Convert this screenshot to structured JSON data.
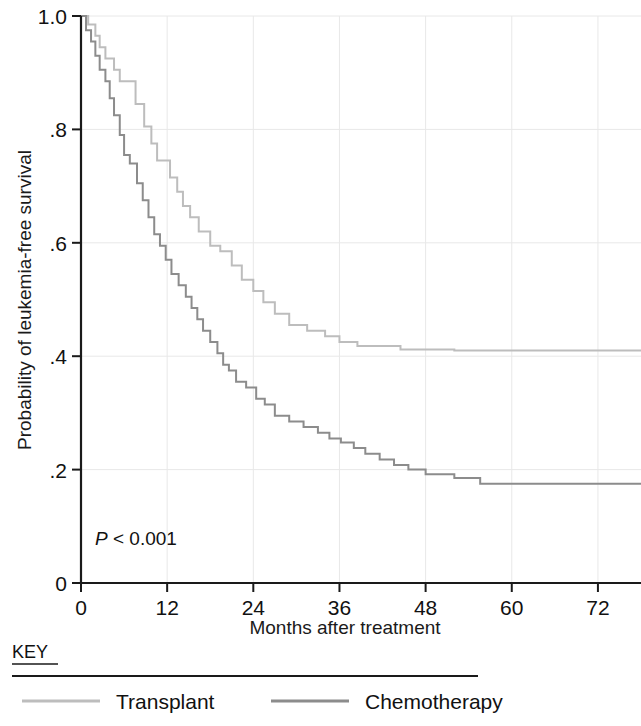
{
  "chart_data": {
    "type": "line",
    "title": "",
    "subtitle": "",
    "xlabel": "Months after treatment",
    "ylabel": "Probability of leukemia-free survival",
    "xlim": [
      0,
      78
    ],
    "ylim": [
      0,
      1.0
    ],
    "xticks": [
      0,
      12,
      24,
      36,
      48,
      60,
      72
    ],
    "xtick_labels": [
      "0",
      "12",
      "24",
      "36",
      "48",
      "60",
      "72"
    ],
    "yticks": [
      0,
      0.2,
      0.4,
      0.6,
      0.8,
      1.0
    ],
    "ytick_labels": [
      "0",
      ".2",
      ".4",
      ".6",
      ".8",
      "1.0"
    ],
    "grid": true,
    "legend_position": "below-axis",
    "step_type": "post",
    "annotations": [
      {
        "name": "p-value",
        "text_italic": "P",
        "text_rest": " < 0.001",
        "x": 3,
        "y": 0.075
      }
    ],
    "series": [
      {
        "name": "Transplant",
        "color": "#bdbdbd",
        "final_value": 0.41,
        "points": [
          [
            0,
            1.0
          ],
          [
            1.0,
            1.0
          ],
          [
            1.0,
            0.985
          ],
          [
            2.0,
            0.985
          ],
          [
            2.0,
            0.965
          ],
          [
            2.6,
            0.965
          ],
          [
            2.6,
            0.945
          ],
          [
            3.4,
            0.945
          ],
          [
            3.4,
            0.925
          ],
          [
            4.6,
            0.925
          ],
          [
            4.6,
            0.905
          ],
          [
            5.4,
            0.905
          ],
          [
            5.4,
            0.885
          ],
          [
            7.6,
            0.885
          ],
          [
            7.6,
            0.845
          ],
          [
            8.8,
            0.845
          ],
          [
            8.8,
            0.805
          ],
          [
            9.8,
            0.805
          ],
          [
            9.8,
            0.775
          ],
          [
            10.6,
            0.775
          ],
          [
            10.6,
            0.745
          ],
          [
            12.4,
            0.745
          ],
          [
            12.4,
            0.715
          ],
          [
            13.4,
            0.715
          ],
          [
            13.4,
            0.69
          ],
          [
            14.2,
            0.69
          ],
          [
            14.2,
            0.665
          ],
          [
            15.2,
            0.665
          ],
          [
            15.2,
            0.645
          ],
          [
            16.4,
            0.645
          ],
          [
            16.4,
            0.62
          ],
          [
            18.0,
            0.62
          ],
          [
            18.0,
            0.595
          ],
          [
            19.4,
            0.595
          ],
          [
            19.4,
            0.585
          ],
          [
            21.0,
            0.585
          ],
          [
            21.0,
            0.56
          ],
          [
            22.4,
            0.56
          ],
          [
            22.4,
            0.535
          ],
          [
            24.0,
            0.535
          ],
          [
            24.0,
            0.515
          ],
          [
            25.4,
            0.515
          ],
          [
            25.4,
            0.495
          ],
          [
            27.0,
            0.495
          ],
          [
            27.0,
            0.475
          ],
          [
            29.0,
            0.475
          ],
          [
            29.0,
            0.455
          ],
          [
            31.5,
            0.455
          ],
          [
            31.5,
            0.445
          ],
          [
            34.0,
            0.445
          ],
          [
            34.0,
            0.435
          ],
          [
            36.0,
            0.435
          ],
          [
            36.0,
            0.425
          ],
          [
            38.5,
            0.425
          ],
          [
            38.5,
            0.418
          ],
          [
            44.5,
            0.418
          ],
          [
            44.5,
            0.412
          ],
          [
            52.0,
            0.412
          ],
          [
            52.0,
            0.41
          ],
          [
            78,
            0.41
          ]
        ]
      },
      {
        "name": "Chemotherapy",
        "color": "#8c8c8c",
        "final_value": 0.175,
        "points": [
          [
            0,
            1.0
          ],
          [
            0.7,
            1.0
          ],
          [
            0.7,
            0.975
          ],
          [
            1.4,
            0.975
          ],
          [
            1.4,
            0.955
          ],
          [
            2.0,
            0.955
          ],
          [
            2.0,
            0.93
          ],
          [
            2.6,
            0.93
          ],
          [
            2.6,
            0.905
          ],
          [
            3.4,
            0.905
          ],
          [
            3.4,
            0.885
          ],
          [
            4.0,
            0.885
          ],
          [
            4.0,
            0.855
          ],
          [
            4.6,
            0.855
          ],
          [
            4.6,
            0.825
          ],
          [
            5.4,
            0.825
          ],
          [
            5.4,
            0.79
          ],
          [
            6.0,
            0.79
          ],
          [
            6.0,
            0.755
          ],
          [
            6.8,
            0.755
          ],
          [
            6.8,
            0.74
          ],
          [
            7.8,
            0.74
          ],
          [
            7.8,
            0.705
          ],
          [
            8.6,
            0.705
          ],
          [
            8.6,
            0.675
          ],
          [
            9.4,
            0.675
          ],
          [
            9.4,
            0.645
          ],
          [
            10.2,
            0.645
          ],
          [
            10.2,
            0.615
          ],
          [
            11.0,
            0.615
          ],
          [
            11.0,
            0.595
          ],
          [
            11.8,
            0.595
          ],
          [
            11.8,
            0.57
          ],
          [
            12.6,
            0.57
          ],
          [
            12.6,
            0.545
          ],
          [
            13.6,
            0.545
          ],
          [
            13.6,
            0.525
          ],
          [
            14.6,
            0.525
          ],
          [
            14.6,
            0.505
          ],
          [
            15.4,
            0.505
          ],
          [
            15.4,
            0.485
          ],
          [
            16.2,
            0.485
          ],
          [
            16.2,
            0.465
          ],
          [
            17.0,
            0.465
          ],
          [
            17.0,
            0.445
          ],
          [
            18.0,
            0.445
          ],
          [
            18.0,
            0.425
          ],
          [
            19.0,
            0.425
          ],
          [
            19.0,
            0.405
          ],
          [
            19.8,
            0.405
          ],
          [
            19.8,
            0.385
          ],
          [
            20.6,
            0.385
          ],
          [
            20.6,
            0.375
          ],
          [
            21.6,
            0.375
          ],
          [
            21.6,
            0.355
          ],
          [
            23.0,
            0.355
          ],
          [
            23.0,
            0.345
          ],
          [
            24.4,
            0.345
          ],
          [
            24.4,
            0.325
          ],
          [
            25.6,
            0.325
          ],
          [
            25.6,
            0.315
          ],
          [
            27.0,
            0.315
          ],
          [
            27.0,
            0.295
          ],
          [
            29.0,
            0.295
          ],
          [
            29.0,
            0.285
          ],
          [
            31.0,
            0.285
          ],
          [
            31.0,
            0.275
          ],
          [
            33.0,
            0.275
          ],
          [
            33.0,
            0.265
          ],
          [
            34.6,
            0.265
          ],
          [
            34.6,
            0.255
          ],
          [
            36.2,
            0.255
          ],
          [
            36.2,
            0.248
          ],
          [
            38.0,
            0.248
          ],
          [
            38.0,
            0.238
          ],
          [
            39.6,
            0.238
          ],
          [
            39.6,
            0.228
          ],
          [
            41.6,
            0.228
          ],
          [
            41.6,
            0.218
          ],
          [
            43.6,
            0.218
          ],
          [
            43.6,
            0.208
          ],
          [
            45.6,
            0.208
          ],
          [
            45.6,
            0.2
          ],
          [
            48.0,
            0.2
          ],
          [
            48.0,
            0.192
          ],
          [
            52.0,
            0.192
          ],
          [
            52.0,
            0.185
          ],
          [
            55.6,
            0.185
          ],
          [
            55.6,
            0.175
          ],
          [
            78,
            0.175
          ]
        ]
      }
    ]
  },
  "axes": {
    "y_axis_title": "Probability of leukemia-free survival",
    "x_axis_title": "Months after treatment",
    "y_tick_labels": [
      "1.0",
      ".8",
      ".6",
      ".4",
      ".2",
      "0"
    ],
    "x_tick_labels": [
      "0",
      "12",
      "24",
      "36",
      "48",
      "60",
      "72"
    ]
  },
  "annotation": {
    "p_symbol": "P",
    "p_text": " < 0.001"
  },
  "legend": {
    "title": "KEY",
    "entries": [
      {
        "label": "Transplant",
        "color": "#bdbdbd"
      },
      {
        "label": "Chemotherapy",
        "color": "#8c8c8c"
      }
    ]
  },
  "colors": {
    "transplant": "#bdbdbd",
    "chemotherapy": "#8c8c8c",
    "axis": "#1a1a1a",
    "grid": "#e8e8e8",
    "background": "#ffffff"
  }
}
